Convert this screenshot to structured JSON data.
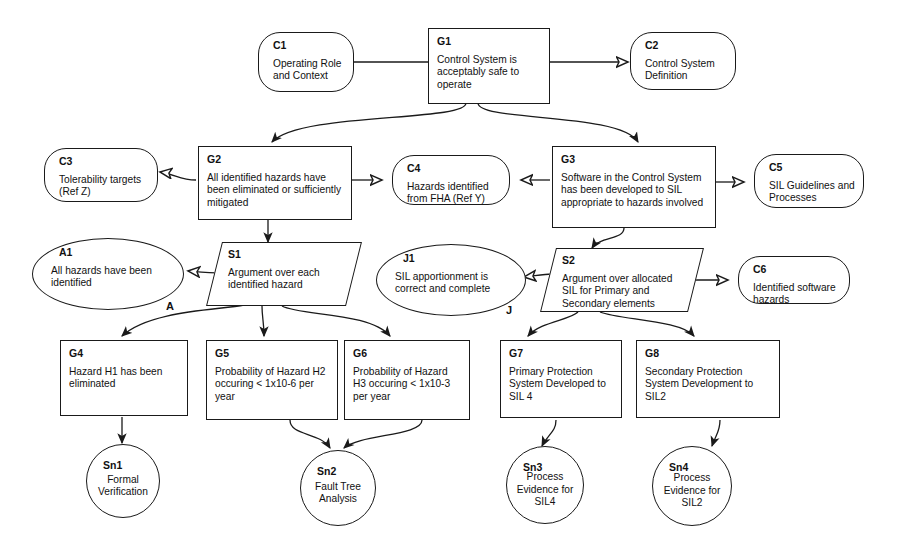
{
  "diagram": {
    "stroke_color": "#1a1a1a",
    "background_color": "#ffffff"
  },
  "nodes": {
    "g1": {
      "id": "G1",
      "text": "Control System is acceptably safe to operate",
      "type": "goal"
    },
    "c1": {
      "id": "C1",
      "text": "Operating Role and Context",
      "type": "context"
    },
    "c2": {
      "id": "C2",
      "text": "Control System Definition",
      "type": "context"
    },
    "c3": {
      "id": "C3",
      "text": "Tolerability targets (Ref Z)",
      "type": "context"
    },
    "g2": {
      "id": "G2",
      "text": "All identified hazards have been eliminated or sufficiently mitigated",
      "type": "goal"
    },
    "c4": {
      "id": "C4",
      "text": "Hazards identified from FHA (Ref Y)",
      "type": "context"
    },
    "g3": {
      "id": "G3",
      "text": "Software in the Control System has been developed to SIL appropriate to hazards involved",
      "type": "goal"
    },
    "c5": {
      "id": "C5",
      "text": "SIL Guidelines and Processes",
      "type": "context"
    },
    "a1": {
      "id": "A1",
      "text": "All hazards have been identified",
      "type": "assumption",
      "marker": "A"
    },
    "s1": {
      "id": "S1",
      "text": "Argument over each identified hazard",
      "type": "strategy"
    },
    "j1": {
      "id": "J1",
      "text": "SIL apportionment is correct and complete",
      "type": "justification",
      "marker": "J"
    },
    "s2": {
      "id": "S2",
      "text": "Argument over allocated SIL for Primary and Secondary elements",
      "type": "strategy"
    },
    "c6": {
      "id": "C6",
      "text": "Identified software hazards",
      "type": "context"
    },
    "g4": {
      "id": "G4",
      "text": "Hazard H1 has been eliminated",
      "type": "goal"
    },
    "g5": {
      "id": "G5",
      "text": "Probability of Hazard H2 occuring < 1x10-6 per year",
      "type": "goal"
    },
    "g6": {
      "id": "G6",
      "text": "Probability of Hazard H3 occuring < 1x10-3 per year",
      "type": "goal"
    },
    "g7": {
      "id": "G7",
      "text": "Primary Protection System Developed to SIL 4",
      "type": "goal"
    },
    "g8": {
      "id": "G8",
      "text": "Secondary Protection System Development to SIL2",
      "type": "goal"
    },
    "sn1": {
      "id": "Sn1",
      "text": "Formal Verification",
      "type": "solution"
    },
    "sn2": {
      "id": "Sn2",
      "text": "Fault Tree Analysis",
      "type": "solution"
    },
    "sn3": {
      "id": "Sn3",
      "text": "Process Evidence for SIL4",
      "type": "solution"
    },
    "sn4": {
      "id": "Sn4",
      "text": "Process Evidence for SIL2",
      "type": "solution"
    }
  },
  "markers": {
    "a": "A",
    "j": "J"
  }
}
